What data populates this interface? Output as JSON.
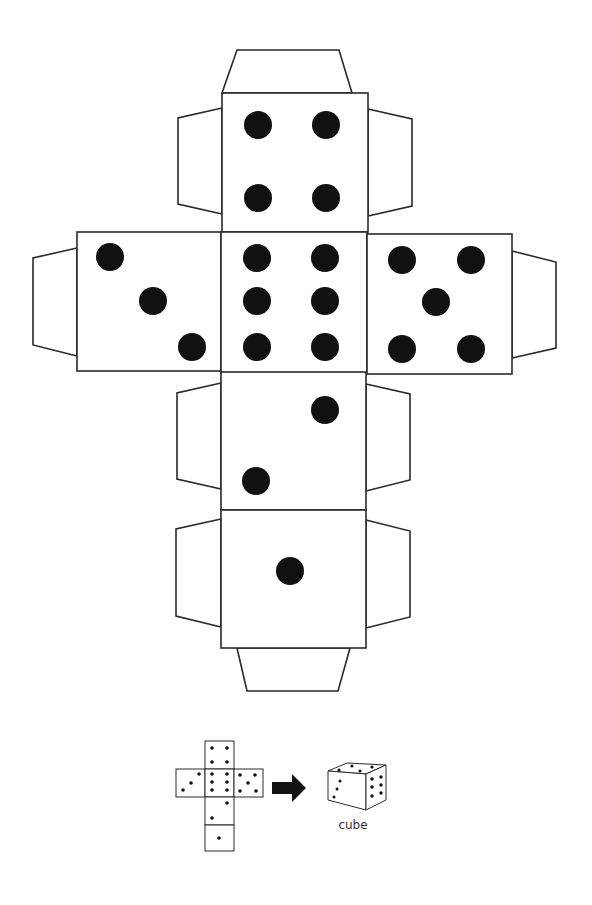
{
  "diagram": {
    "faces": [
      {
        "position": "top",
        "pips": 4
      },
      {
        "position": "left",
        "pips": 3
      },
      {
        "position": "center",
        "pips": 6
      },
      {
        "position": "right",
        "pips": 5
      },
      {
        "position": "lower",
        "pips": 2
      },
      {
        "position": "bottom",
        "pips": 1
      }
    ],
    "tabs": [
      "top",
      "top-left",
      "top-right",
      "left",
      "right",
      "lower-left",
      "lower-right",
      "bottom-left",
      "bottom-right",
      "bottom"
    ],
    "legend": {
      "arrow": "arrow-right",
      "result_label": "cube"
    },
    "colors": {
      "line": "#2a2a2a",
      "pip": "#111111",
      "background": "#ffffff"
    }
  }
}
